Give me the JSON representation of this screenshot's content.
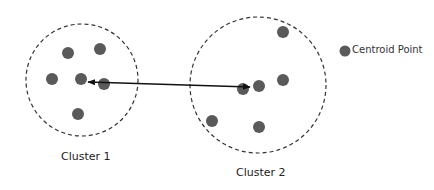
{
  "colors": {
    "point": "#5a5a5a",
    "circle": "#333333",
    "arrow": "#111111",
    "background": "#ffffff"
  },
  "legend": {
    "label": "Centroid Point",
    "icon": "filled-circle"
  },
  "clusters": [
    {
      "label": "Cluster 1",
      "boundary": {
        "cx": 82,
        "cy": 80,
        "r": 56
      },
      "centroid": {
        "x": 81,
        "y": 79
      },
      "points": [
        {
          "x": 68,
          "y": 53
        },
        {
          "x": 100,
          "y": 49
        },
        {
          "x": 52,
          "y": 79
        },
        {
          "x": 104,
          "y": 84
        },
        {
          "x": 78,
          "y": 114
        }
      ]
    },
    {
      "label": "Cluster 2",
      "boundary": {
        "cx": 258,
        "cy": 85,
        "r": 68
      },
      "centroid": {
        "x": 259,
        "y": 86
      },
      "points": [
        {
          "x": 283,
          "y": 32
        },
        {
          "x": 283,
          "y": 80
        },
        {
          "x": 243,
          "y": 89
        },
        {
          "x": 212,
          "y": 121
        },
        {
          "x": 259,
          "y": 127
        }
      ]
    }
  ],
  "connector": {
    "type": "double-arrow",
    "from": {
      "x": 88,
      "y": 82
    },
    "to": {
      "x": 250,
      "y": 87
    },
    "meaning": "distance between centroids"
  }
}
